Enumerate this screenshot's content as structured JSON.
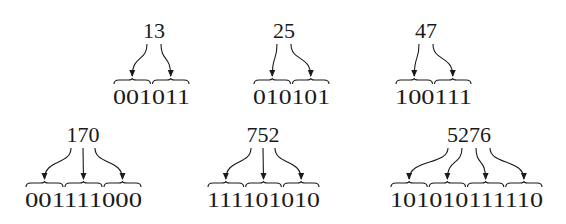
{
  "items": [
    {
      "decimal": "13",
      "binary": "001011",
      "groups": 2,
      "cx": 154,
      "top": 38,
      "braceY": 80,
      "binX": 113,
      "binW": 77
    },
    {
      "decimal": "25",
      "binary": "010101",
      "groups": 2,
      "cx": 284,
      "top": 38,
      "braceY": 80,
      "binX": 253,
      "binW": 77
    },
    {
      "decimal": "47",
      "binary": "100111",
      "groups": 2,
      "cx": 426,
      "top": 38,
      "braceY": 80,
      "binX": 395,
      "binW": 77
    },
    {
      "decimal": "170",
      "binary": "001111000",
      "groups": 3,
      "cx": 83,
      "top": 142,
      "braceY": 183,
      "binX": 25,
      "binW": 117
    },
    {
      "decimal": "752",
      "binary": "111101010",
      "groups": 3,
      "cx": 263,
      "top": 142,
      "braceY": 183,
      "binX": 207,
      "binW": 113
    },
    {
      "decimal": "5276",
      "binary": "101010111110",
      "groups": 4,
      "cx": 469,
      "top": 142,
      "braceY": 183,
      "binX": 390,
      "binW": 153
    }
  ]
}
